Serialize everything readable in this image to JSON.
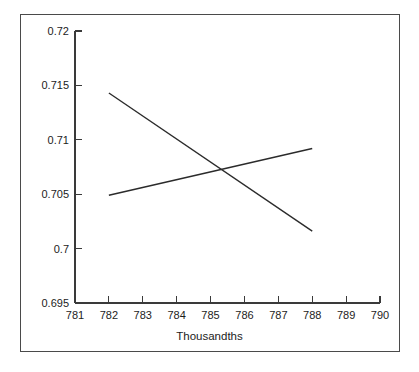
{
  "chart_data": {
    "type": "line",
    "title": "",
    "subtitle": "",
    "xlabel": "Thousandths",
    "ylabel": "",
    "xlim": [
      781,
      790
    ],
    "ylim": [
      0.695,
      0.72
    ],
    "grid": false,
    "legend": null,
    "x_ticks": [
      "781",
      "782",
      "783",
      "784",
      "785",
      "786",
      "787",
      "788",
      "789",
      "790"
    ],
    "y_ticks": [
      "0.695",
      "0.7",
      "0.705",
      "0.71",
      "0.715",
      "0.72"
    ],
    "x_tick_values": [
      781,
      782,
      783,
      784,
      785,
      786,
      787,
      788,
      789,
      790
    ],
    "y_tick_values": [
      0.695,
      0.7,
      0.705,
      0.71,
      0.715,
      0.72
    ],
    "series": [
      {
        "name": "descending-line",
        "color": "#2b2b2b",
        "x": [
          782,
          788
        ],
        "values": [
          0.7143,
          0.7016
        ]
      },
      {
        "name": "ascending-line",
        "color": "#2b2b2b",
        "x": [
          782,
          788
        ],
        "values": [
          0.7049,
          0.7092
        ]
      }
    ],
    "intersection": {
      "x": 785.35,
      "y": 0.7071
    }
  },
  "figure": {
    "background_color": "#ffffff",
    "frame_color": "#4a4a4a",
    "axis_color": "#3a3a3a",
    "text_color": "#1c1c1c"
  }
}
